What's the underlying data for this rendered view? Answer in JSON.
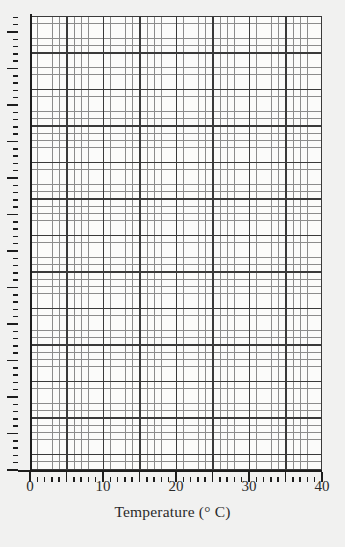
{
  "chart_data": {
    "type": "grid",
    "title": "",
    "subtitle": "",
    "xlabel": "Temperature (° C)",
    "ylabel": "",
    "xlim": [
      0,
      40
    ],
    "ylim": [
      0,
      62
    ],
    "x_major_step": 5,
    "x_minor_step": 1,
    "y_major_step": 5,
    "y_minor_step": 1,
    "grid": true,
    "legend": null,
    "series": [],
    "values": [],
    "categories": [],
    "annotations": [],
    "note": "Blank graph-paper grid; no data series plotted. Y axis has unlabeled tick marks."
  },
  "axes": {
    "x": {
      "label": "Temperature (° C)",
      "label_parts": {
        "name": "Temperature",
        "open_paren": "(",
        "degree": "°",
        "unit": "C",
        "close_paren": ")"
      },
      "min": 0,
      "max": 40,
      "tick_labels": [
        "0",
        "10",
        "20",
        "30",
        "40"
      ],
      "tick_values": [
        0,
        10,
        20,
        30,
        40
      ],
      "major_ticks": [
        0,
        5,
        10,
        15,
        20,
        25,
        30,
        35,
        40
      ],
      "minor_tick_step": 1
    },
    "y": {
      "label": "",
      "min": 0,
      "max": 62,
      "tick_labels": [],
      "major_tick_count": 13,
      "minor_tick_step": 1
    }
  },
  "colors": {
    "background": "#f1f1f0",
    "plot_background": "#fbfbfa",
    "grid_minor": "#8c8c8c",
    "grid_major": "#3a3a3a",
    "axis": "#1d1d1d",
    "text": "#2a2a2a"
  }
}
